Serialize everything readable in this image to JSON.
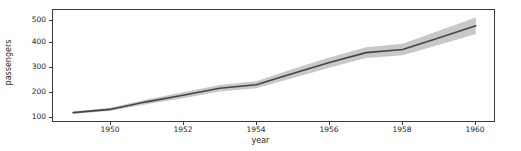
{
  "chart_data": {
    "type": "line",
    "title": "",
    "xlabel": "year",
    "ylabel": "passengers",
    "xlim": [
      1948.45,
      1960.55
    ],
    "ylim": [
      85,
      540
    ],
    "grid": false,
    "legend": null,
    "xticks": [
      1950,
      1952,
      1954,
      1956,
      1958,
      1960
    ],
    "xtick_labels": [
      "1950",
      "1952",
      "1954",
      "1956",
      "1958",
      "1960"
    ],
    "yticks": [
      100,
      200,
      300,
      400,
      500
    ],
    "ytick_labels": [
      "100",
      "200",
      "300",
      "400",
      "500"
    ],
    "x": [
      1949,
      1950,
      1951,
      1952,
      1953,
      1954,
      1955,
      1956,
      1957,
      1958,
      1959,
      1960
    ],
    "series": [
      {
        "name": "passengers",
        "values": [
          126.7,
          139.7,
          170.2,
          197.0,
          225.0,
          238.9,
          284.0,
          328.2,
          368.4,
          381.0,
          428.3,
          476.2
        ],
        "ci_lower": [
          122.0,
          133.0,
          160.0,
          185.0,
          212.0,
          225.0,
          266.0,
          307.0,
          347.0,
          358.0,
          400.0,
          443.0
        ],
        "ci_upper": [
          131.0,
          146.0,
          180.0,
          209.0,
          238.0,
          253.0,
          302.0,
          349.0,
          390.0,
          404.0,
          457.0,
          510.0
        ],
        "line_color": "#444444",
        "band_color": "#c8c8c8"
      }
    ],
    "colors": {
      "line": "#444444",
      "band": "#c8c8c8",
      "axis": "#3b3b3b",
      "text": "#262626",
      "background": "#ffffff"
    }
  }
}
